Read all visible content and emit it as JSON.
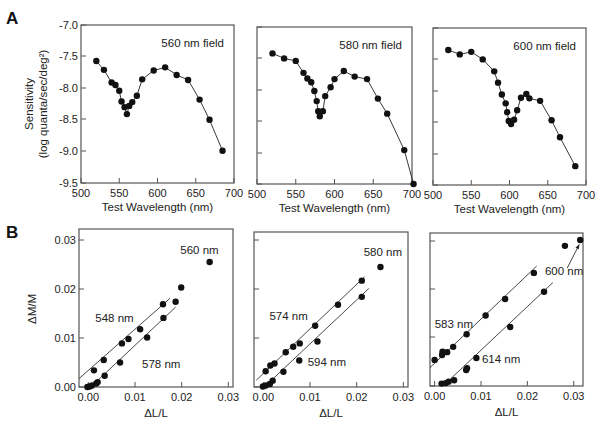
{
  "panel_labels": {
    "A": "A",
    "B": "B"
  },
  "chart_data": [
    {
      "id": "A1",
      "type": "line",
      "panel": "A",
      "annotation": "560 nm field",
      "xlabel": "Test Wavelength (nm)",
      "ylabel": "Sensitivity",
      "ylabel2": "(log quanta/sec/deg²)",
      "xlim": [
        500,
        700
      ],
      "ylim": [
        -9.5,
        -7.0
      ],
      "xticks": [
        500,
        550,
        600,
        650,
        700
      ],
      "yticks": [
        -7.0,
        -7.5,
        -8.0,
        -8.5,
        -9.0,
        -9.5
      ],
      "ytick_labels": [
        "-7.0",
        "-7.5",
        "-8.0",
        "-8.5",
        "-9.0",
        "-9.5"
      ],
      "x": [
        520,
        530,
        540,
        545,
        550,
        553,
        557,
        560,
        563,
        567,
        573,
        580,
        595,
        610,
        625,
        640,
        655,
        668,
        685
      ],
      "y": [
        -7.57,
        -7.71,
        -7.91,
        -7.95,
        -8.04,
        -8.21,
        -8.3,
        -8.41,
        -8.28,
        -8.22,
        -8.12,
        -7.86,
        -7.72,
        -7.67,
        -7.79,
        -7.87,
        -8.18,
        -8.5,
        -8.99
      ]
    },
    {
      "id": "A2",
      "type": "line",
      "panel": "A",
      "annotation": "580 nm field",
      "xlabel": "Test Wavelength (nm)",
      "xlim": [
        500,
        700
      ],
      "ylim": [
        -9.5,
        -7.0
      ],
      "xticks": [
        500,
        550,
        600,
        650,
        700
      ],
      "yticks": [
        -7.0,
        -7.5,
        -8.0,
        -8.5,
        -9.0,
        -9.5
      ],
      "x": [
        520,
        535,
        550,
        560,
        565,
        570,
        574,
        577,
        579,
        581,
        585,
        588,
        595,
        600,
        612,
        626,
        642,
        656,
        668,
        690,
        702
      ],
      "y": [
        -7.42,
        -7.5,
        -7.54,
        -7.73,
        -7.82,
        -7.88,
        -8.02,
        -8.18,
        -8.34,
        -8.42,
        -8.34,
        -8.1,
        -7.96,
        -7.83,
        -7.7,
        -7.79,
        -7.83,
        -8.14,
        -8.38,
        -8.96,
        -9.5
      ]
    },
    {
      "id": "A3",
      "type": "line",
      "panel": "A",
      "annotation": "600 nm field",
      "xlabel": "Test Wavelength (nm)",
      "xlim": [
        500,
        700
      ],
      "ylim": [
        -9.5,
        -7.0
      ],
      "xticks": [
        500,
        550,
        600,
        650,
        700
      ],
      "yticks": [
        -7.0,
        -7.5,
        -8.0,
        -8.5,
        -9.0,
        -9.5
      ],
      "x": [
        520,
        535,
        550,
        565,
        580,
        585,
        590,
        595,
        597,
        599,
        602,
        606,
        610,
        615,
        622,
        626,
        640,
        655,
        666,
        686
      ],
      "y": [
        -7.35,
        -7.42,
        -7.38,
        -7.5,
        -7.69,
        -7.87,
        -8.06,
        -8.2,
        -8.34,
        -8.48,
        -8.53,
        -8.46,
        -8.31,
        -8.11,
        -8.05,
        -8.12,
        -8.16,
        -8.47,
        -8.74,
        -9.2
      ]
    },
    {
      "id": "B1",
      "type": "scatter",
      "panel": "B",
      "xlabel": "ΔL/L",
      "ylabel": "ΔM/M",
      "xlim": [
        -0.002,
        0.031
      ],
      "ylim": [
        0.0,
        0.032
      ],
      "xticks": [
        0.0,
        0.01,
        0.02,
        0.03
      ],
      "xtick_labels": [
        "0.00",
        "0.01",
        "0.02",
        "0.03"
      ],
      "yticks": [
        0.0,
        0.01,
        0.02,
        0.03
      ],
      "ytick_labels": [
        "0.00",
        "0.01",
        "0.02",
        "0.03"
      ],
      "series": [
        {
          "name": "548 nm",
          "x": [
            0.0012,
            0.0033,
            0.0072,
            0.0086,
            0.0111,
            0.016
          ],
          "y": [
            0.0034,
            0.0055,
            0.0089,
            0.0098,
            0.0118,
            0.0169
          ],
          "fit": [
            [
              -0.002,
              0.0017
            ],
            [
              0.0175,
              0.0181
            ]
          ]
        },
        {
          "name": "578 nm",
          "x": [
            -0.0002,
            0.0003,
            0.0008,
            0.0017,
            0.002,
            0.0035,
            0.0068,
            0.0126,
            0.0161,
            0.0187
          ],
          "y": [
            0.0,
            0.0001,
            0.0003,
            0.0007,
            0.001,
            0.0023,
            0.005,
            0.0101,
            0.0141,
            0.0174
          ],
          "fit": [
            [
              0.0005,
              0.0
            ],
            [
              0.0187,
              0.0163
            ]
          ]
        },
        {
          "name": "560 nm",
          "x": [
            0.0199,
            0.026
          ],
          "y": [
            0.0203,
            0.0255
          ],
          "fit": null
        }
      ],
      "annotations": [
        {
          "text": "548 nm",
          "x": 0.0015,
          "y": 0.0132
        },
        {
          "text": "578 nm",
          "x": 0.0115,
          "y": 0.0039
        },
        {
          "text": "560 nm",
          "x": 0.0197,
          "y": 0.0272
        }
      ]
    },
    {
      "id": "B2",
      "type": "scatter",
      "panel": "B",
      "xlabel": "ΔL/L",
      "xlim": [
        -0.002,
        0.031
      ],
      "ylim": [
        0.0,
        0.032
      ],
      "xticks": [
        0.0,
        0.01,
        0.02,
        0.03
      ],
      "xtick_labels": [
        "0.00",
        "0.01",
        "0.02",
        "0.03"
      ],
      "yticks": [
        0.0,
        0.01,
        0.02,
        0.03
      ],
      "series": [
        {
          "name": "574 nm",
          "x": [
            0.0005,
            0.0015,
            0.0024,
            0.0048,
            0.0064,
            0.0078,
            0.0111,
            0.016,
            0.0211
          ],
          "y": [
            0.0032,
            0.0044,
            0.0048,
            0.0071,
            0.0082,
            0.0089,
            0.0125,
            0.0168,
            0.0217
          ],
          "fit": [
            [
              -0.0015,
              0.0014
            ],
            [
              0.0217,
              0.0225
            ]
          ]
        },
        {
          "name": "594 nm",
          "x": [
            -0.0001,
            0.0005,
            0.0014,
            0.002,
            0.0043,
            0.0077,
            0.0116,
            0.0211
          ],
          "y": [
            0.0001,
            0.0003,
            0.0006,
            0.0013,
            0.0031,
            0.0054,
            0.0093,
            0.0184
          ],
          "fit": [
            [
              0.0002,
              0.0
            ],
            [
              0.0226,
              0.0201
            ]
          ]
        },
        {
          "name": "580 nm",
          "x": [
            0.0251
          ],
          "y": [
            0.0245
          ],
          "fit": null
        }
      ],
      "annotations": [
        {
          "text": "574 nm",
          "x": 0.0013,
          "y": 0.0136
        },
        {
          "text": "594 nm",
          "x": 0.0095,
          "y": 0.0043
        },
        {
          "text": "580 nm",
          "x": 0.0215,
          "y": 0.0267
        }
      ]
    },
    {
      "id": "B3",
      "type": "scatter",
      "panel": "B",
      "xlabel": "ΔL/L",
      "xlim": [
        -0.001,
        0.032
      ],
      "ylim": [
        0.0,
        0.032
      ],
      "xticks": [
        0.0,
        0.01,
        0.02,
        0.03
      ],
      "xtick_labels": [
        "0.00",
        "0.01",
        "0.02",
        "0.03"
      ],
      "yticks": [
        0.0,
        0.01,
        0.02,
        0.03
      ],
      "series": [
        {
          "name": "583 nm",
          "x": [
            0.0,
            0.0016,
            0.0017,
            0.0027,
            0.004,
            0.0069,
            0.011,
            0.0152,
            0.0214
          ],
          "y": [
            0.0054,
            0.0064,
            0.0071,
            0.007,
            0.0081,
            0.0107,
            0.0146,
            0.018,
            0.0234
          ],
          "fit": [
            [
              -0.001,
              0.0038
            ],
            [
              0.022,
              0.0248
            ]
          ]
        },
        {
          "name": "614 nm",
          "x": [
            0.0015,
            0.0024,
            0.003,
            0.0042,
            0.0068,
            0.007,
            0.009,
            0.0163,
            0.0236
          ],
          "y": [
            0.0005,
            0.0006,
            0.0009,
            0.0012,
            0.0033,
            0.0037,
            0.0058,
            0.0122,
            0.0195
          ],
          "fit": [
            [
              0.0018,
              0.0
            ],
            [
              0.0255,
              0.0214
            ]
          ]
        },
        {
          "name": "600 nm",
          "x": [
            0.0281,
            0.0314
          ],
          "y": [
            0.029,
            0.0302
          ],
          "fit": null
        }
      ],
      "annotations": [
        {
          "text": "583 nm",
          "x": 0.0,
          "y": 0.0119
        },
        {
          "text": "614 nm",
          "x": 0.0102,
          "y": 0.0048
        },
        {
          "text": "600 nm",
          "x": 0.0238,
          "y": 0.023
        }
      ],
      "arrow": {
        "from": [
          0.0286,
          0.0244
        ],
        "to": [
          0.0312,
          0.0293
        ]
      }
    }
  ],
  "layout": {
    "frames": {
      "A1": {
        "left": 81,
        "top": 25,
        "right": 234,
        "bottom": 183
      },
      "A2": {
        "left": 257,
        "top": 27,
        "right": 412,
        "bottom": 184
      },
      "A3": {
        "left": 433,
        "top": 28,
        "right": 586,
        "bottom": 185
      },
      "B1": {
        "left": 79,
        "top": 229,
        "right": 233,
        "bottom": 387
      },
      "B2": {
        "left": 254,
        "top": 232,
        "right": 408,
        "bottom": 387
      },
      "B3": {
        "left": 430,
        "top": 233,
        "right": 583,
        "bottom": 386
      }
    },
    "ytick_px": {
      "A1": [
        25,
        56,
        88,
        119,
        151,
        183
      ],
      "A2": [
        27,
        58,
        90,
        121,
        153,
        184
      ],
      "A3": [
        28,
        59,
        91,
        122,
        154,
        185
      ],
      "B1": [
        387,
        338,
        289,
        240
      ],
      "B2": [
        387,
        338,
        289,
        240
      ],
      "B3": [
        386,
        337,
        289,
        241
      ]
    }
  }
}
